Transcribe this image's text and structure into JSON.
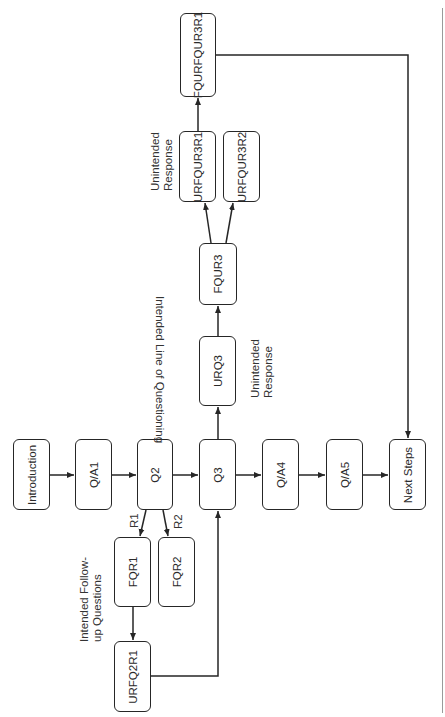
{
  "diagram": {
    "orientation": "rotated 90° counter-clockwise (text reads bottom-to-top)",
    "nodes": {
      "introduction": "Introduction",
      "qa1": "Q/A1",
      "q2": "Q2",
      "q3": "Q3",
      "qa4": "Q/A4",
      "qa5": "Q/A5",
      "next_steps": "Next Steps",
      "fqr1": "FQR1",
      "fqr2": "FQR2",
      "urfq2r1": "URFQ2R1",
      "urq3": "URQ3",
      "fqur3": "FQUR3",
      "urfqur3r1": "URFQUR3R1",
      "urfqur3r2": "URFQUR3R2",
      "fqurfqur3r1": "FQURFQUR3R1"
    },
    "annotations": {
      "intended_line": "Intended Line of Questioning",
      "intended_followup_line1": "Intended Follow-",
      "intended_followup_line2": "up Questions",
      "unintended_q3_line1": "Unintended",
      "unintended_q3_line2": "Response",
      "unintended_fqur3_line1": "Unintended",
      "unintended_fqur3_line2": "Response",
      "r1": "R1",
      "r2": "R2"
    },
    "edges": [
      {
        "from": "Introduction",
        "to": "Q/A1"
      },
      {
        "from": "Q/A1",
        "to": "Q2"
      },
      {
        "from": "Q2",
        "to": "Q3"
      },
      {
        "from": "Q3",
        "to": "Q/A4"
      },
      {
        "from": "Q/A4",
        "to": "Q/A5"
      },
      {
        "from": "Q/A5",
        "to": "Next Steps"
      },
      {
        "from": "Q2",
        "to": "FQR1",
        "label": "R1"
      },
      {
        "from": "Q2",
        "to": "FQR2",
        "label": "R2"
      },
      {
        "from": "FQR1",
        "to": "URFQ2R1"
      },
      {
        "from": "URFQ2R1",
        "to": "Q3"
      },
      {
        "from": "Q3",
        "to": "URQ3"
      },
      {
        "from": "URQ3",
        "to": "FQUR3"
      },
      {
        "from": "FQUR3",
        "to": "URFQUR3R1"
      },
      {
        "from": "FQUR3",
        "to": "URFQUR3R2"
      },
      {
        "from": "URFQUR3R1",
        "to": "FQURFQUR3R1"
      },
      {
        "from": "FQURFQUR3R1",
        "to": "Next Steps"
      }
    ]
  }
}
